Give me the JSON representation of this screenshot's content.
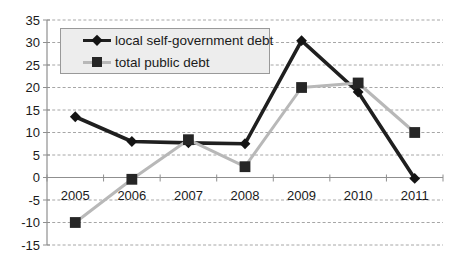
{
  "chart_data": {
    "type": "line",
    "title": "",
    "xlabel": "",
    "ylabel": "",
    "categories": [
      "2005",
      "2006",
      "2007",
      "2008",
      "2009",
      "2010",
      "2011"
    ],
    "series": [
      {
        "name": "local self-government debt",
        "values": [
          13.5,
          8,
          7.7,
          7.5,
          30.4,
          19,
          -0.2
        ],
        "color": "#1f1f1f",
        "marker": "diamond",
        "marker_color": "#141414",
        "line_width": 3.6
      },
      {
        "name": "total public debt",
        "values": [
          -10,
          -0.4,
          8.4,
          2.4,
          20,
          21,
          10
        ],
        "color": "#b8b8b8",
        "marker": "square",
        "marker_color": "#262626",
        "line_width": 3
      }
    ],
    "ylim": [
      -15,
      35
    ],
    "ytick_step": 5,
    "y_tick_labels": [
      "35",
      "30",
      "25",
      "20",
      "15",
      "10",
      "5",
      "0",
      "-5",
      "-10",
      "-15"
    ],
    "grid": "horizontal-dashed",
    "legend_position": "top-left-inside",
    "colors": {
      "gridline": "#a6a6a6",
      "axis": "#8f8f8f",
      "label": "#1a1a1a",
      "legend_background": "#ededed",
      "legend_border": "#999999",
      "plot_background": "#ffffff"
    }
  }
}
